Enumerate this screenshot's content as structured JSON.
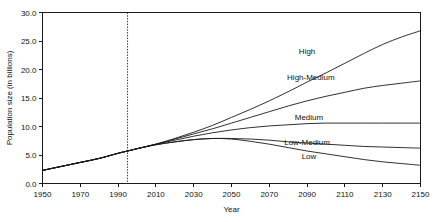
{
  "chart_data": {
    "type": "line",
    "title": "",
    "xlabel": "Year",
    "ylabel": "Population size (in billions)",
    "xlim": [
      1950,
      2150
    ],
    "ylim": [
      0.0,
      30.0
    ],
    "grid": false,
    "legend_position": "inline-right-of-curves",
    "x_ticks": [
      1950,
      1970,
      1990,
      2010,
      2030,
      2050,
      2070,
      2090,
      2110,
      2130,
      2150
    ],
    "x_tick_labels": [
      "1950",
      "1970",
      "1990",
      "2010",
      "2030",
      "2050",
      "2070",
      "2090",
      "2110",
      "2130",
      "2150"
    ],
    "y_ticks": [
      0.0,
      5.0,
      10.0,
      15.0,
      20.0,
      25.0,
      30.0
    ],
    "y_tick_labels": [
      "0.0",
      "5.0",
      "10.0",
      "15.0",
      "20.0",
      "25.0",
      "30.0"
    ],
    "annotations": [
      {
        "name": "present-year-marker",
        "type": "vertical-dashed-line",
        "x": 1995,
        "label": ""
      }
    ],
    "x": [
      1950,
      1960,
      1970,
      1980,
      1990,
      1995,
      2000,
      2010,
      2020,
      2030,
      2040,
      2050,
      2060,
      2070,
      2080,
      2090,
      2100,
      2110,
      2120,
      2130,
      2140,
      2150
    ],
    "series": [
      {
        "name": "High",
        "label": "High",
        "color": "#1a1a1a",
        "label_x": 2090,
        "label_y": 23.2,
        "values": [
          2.3,
          3.0,
          3.7,
          4.4,
          5.3,
          5.7,
          6.1,
          6.9,
          7.9,
          9.0,
          10.2,
          11.6,
          13.0,
          14.5,
          16.1,
          17.8,
          19.4,
          21.1,
          22.8,
          24.4,
          25.7,
          26.8
        ]
      },
      {
        "name": "High-Medium",
        "label": "High-Medium",
        "color": "#1a1a1a",
        "label_x": 2092,
        "label_y": 18.7,
        "values": [
          2.3,
          3.0,
          3.7,
          4.4,
          5.3,
          5.7,
          6.1,
          6.9,
          7.8,
          8.7,
          9.6,
          10.6,
          11.6,
          12.6,
          13.6,
          14.5,
          15.3,
          16.0,
          16.7,
          17.2,
          17.6,
          18.0
        ]
      },
      {
        "name": "Medium",
        "label": "Medium",
        "color": "#1a1a1a",
        "label_x": 2091,
        "label_y": 11.6,
        "values": [
          2.3,
          3.0,
          3.7,
          4.4,
          5.3,
          5.7,
          6.1,
          6.9,
          7.6,
          8.3,
          8.9,
          9.4,
          9.8,
          10.1,
          10.3,
          10.5,
          10.6,
          10.6,
          10.6,
          10.6,
          10.6,
          10.6
        ]
      },
      {
        "name": "Low-Medium",
        "label": "Low-Medium",
        "color": "#1a1a1a",
        "label_x": 2090,
        "label_y": 7.3,
        "values": [
          2.3,
          3.0,
          3.7,
          4.4,
          5.3,
          5.7,
          6.1,
          6.8,
          7.3,
          7.7,
          7.9,
          7.9,
          7.8,
          7.6,
          7.3,
          7.1,
          6.9,
          6.7,
          6.5,
          6.4,
          6.3,
          6.2
        ]
      },
      {
        "name": "Low",
        "label": "Low",
        "color": "#1a1a1a",
        "label_x": 2091,
        "label_y": 4.8,
        "values": [
          2.3,
          3.0,
          3.7,
          4.4,
          5.3,
          5.7,
          6.1,
          6.8,
          7.3,
          7.7,
          7.9,
          7.8,
          7.4,
          6.9,
          6.3,
          5.7,
          5.2,
          4.7,
          4.2,
          3.8,
          3.5,
          3.2
        ]
      }
    ]
  }
}
